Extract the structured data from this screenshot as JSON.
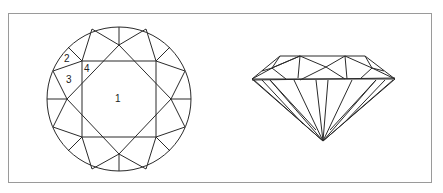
{
  "figure": {
    "top_view": {
      "name": "brilliant-cut-top-view",
      "labels": [
        "1",
        "2",
        "3",
        "4"
      ]
    },
    "side_view": {
      "name": "brilliant-cut-side-view"
    },
    "colors": {
      "line": "#2a2a2a",
      "frame": "#9a9a9a",
      "background": "#ffffff"
    }
  }
}
